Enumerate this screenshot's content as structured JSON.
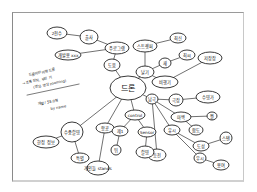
{
  "diagram": {
    "type": "mind-map",
    "style": "hand-drawn",
    "center": {
      "id": "c",
      "label": "드론",
      "x": 128,
      "y": 88,
      "rx": 18,
      "ry": 12
    },
    "nodes": [
      {
        "id": "n1",
        "label": "2천수",
        "x": 57,
        "y": 33,
        "rx": 10,
        "ry": 6
      },
      {
        "id": "n2",
        "label": "출사",
        "x": 89,
        "y": 37,
        "rx": 9,
        "ry": 7
      },
      {
        "id": "n3",
        "label": "주로그램",
        "x": 117,
        "y": 48,
        "rx": 12,
        "ry": 6
      },
      {
        "id": "n4",
        "label": "개발용 xxx",
        "x": 68,
        "y": 55,
        "rx": 13,
        "ry": 5
      },
      {
        "id": "n5",
        "label": "도움",
        "x": 112,
        "y": 65,
        "rx": 8,
        "ry": 6
      },
      {
        "id": "n6",
        "label": "스트렛퍼",
        "x": 145,
        "y": 46,
        "rx": 12,
        "ry": 6
      },
      {
        "id": "n7",
        "label": "최신",
        "x": 178,
        "y": 38,
        "rx": 8,
        "ry": 5
      },
      {
        "id": "n8",
        "label": "날기",
        "x": 145,
        "y": 72,
        "rx": 9,
        "ry": 6
      },
      {
        "id": "n9",
        "label": "새",
        "x": 165,
        "y": 63,
        "rx": 6,
        "ry": 5
      },
      {
        "id": "n10",
        "label": "최씨",
        "x": 187,
        "y": 55,
        "rx": 8,
        "ry": 5
      },
      {
        "id": "n11",
        "label": "비행기",
        "x": 165,
        "y": 82,
        "rx": 13,
        "ry": 6
      },
      {
        "id": "n12",
        "label": "저장장",
        "x": 210,
        "y": 58,
        "rx": 12,
        "ry": 6
      },
      {
        "id": "n13",
        "label": "남극",
        "x": 152,
        "y": 99,
        "rx": 6,
        "ry": 5
      },
      {
        "id": "n14",
        "label": "극장",
        "x": 176,
        "y": 100,
        "rx": 7,
        "ry": 6
      },
      {
        "id": "n15",
        "label": "수영가",
        "x": 208,
        "y": 97,
        "rx": 12,
        "ry": 6
      },
      {
        "id": "n16",
        "label": "마백",
        "x": 181,
        "y": 117,
        "rx": 10,
        "ry": 5
      },
      {
        "id": "n17",
        "label": "뭘",
        "x": 212,
        "y": 116,
        "rx": 5,
        "ry": 4
      },
      {
        "id": "n18",
        "label": "유시",
        "x": 172,
        "y": 130,
        "rx": 8,
        "ry": 5
      },
      {
        "id": "n19",
        "label": "합도",
        "x": 196,
        "y": 130,
        "rx": 7,
        "ry": 5
      },
      {
        "id": "n20",
        "label": "도성",
        "x": 201,
        "y": 146,
        "rx": 8,
        "ry": 5
      },
      {
        "id": "n21",
        "label": "스탠",
        "x": 226,
        "y": 138,
        "rx": 6,
        "ry": 6
      },
      {
        "id": "n22",
        "label": "등전",
        "x": 157,
        "y": 155,
        "rx": 9,
        "ry": 6
      },
      {
        "id": "n23",
        "label": "우시",
        "x": 200,
        "y": 158,
        "rx": 6,
        "ry": 5
      },
      {
        "id": "n24",
        "label": "용여",
        "x": 221,
        "y": 165,
        "rx": 8,
        "ry": 5
      },
      {
        "id": "n25",
        "label": "수중촬영",
        "x": 72,
        "y": 132,
        "rx": 11,
        "ry": 10
      },
      {
        "id": "n26",
        "label": "항공",
        "x": 105,
        "y": 128,
        "rx": 9,
        "ry": 5
      },
      {
        "id": "n27",
        "label": "한정 정보",
        "x": 46,
        "y": 142,
        "rx": 13,
        "ry": 6
      },
      {
        "id": "n28",
        "label": "특별",
        "x": 80,
        "y": 158,
        "rx": 9,
        "ry": 5
      },
      {
        "id": "n29",
        "label": "개인들 stands",
        "x": 98,
        "y": 168,
        "rx": 11,
        "ry": 7
      },
      {
        "id": "n30",
        "label": "control",
        "x": 135,
        "y": 115,
        "rx": 10,
        "ry": 5
      },
      {
        "id": "n31",
        "label": "제1",
        "x": 120,
        "y": 131,
        "rx": 8,
        "ry": 5
      },
      {
        "id": "n32",
        "label": "뒤",
        "x": 116,
        "y": 150,
        "rx": 5,
        "ry": 5
      },
      {
        "id": "n33",
        "label": "Sensor",
        "x": 147,
        "y": 132,
        "rx": 9,
        "ry": 5
      },
      {
        "id": "n34",
        "label": "촬영",
        "x": 145,
        "y": 152,
        "rx": 9,
        "ry": 6
      }
    ],
    "edges": [
      [
        "n1",
        "n2"
      ],
      [
        "n2",
        "n3"
      ],
      [
        "n4",
        "n3"
      ],
      [
        "n3",
        "n5"
      ],
      [
        "n5",
        "c"
      ],
      [
        "c",
        "n8"
      ],
      [
        "n8",
        "n6"
      ],
      [
        "n6",
        "n7"
      ],
      [
        "n8",
        "n9"
      ],
      [
        "n9",
        "n10"
      ],
      [
        "n8",
        "n11"
      ],
      [
        "n11",
        "n12"
      ],
      [
        "c",
        "n13"
      ],
      [
        "n13",
        "n14"
      ],
      [
        "n14",
        "n15"
      ],
      [
        "n13",
        "n16"
      ],
      [
        "n16",
        "n17"
      ],
      [
        "n16",
        "n19"
      ],
      [
        "n13",
        "n18"
      ],
      [
        "n18",
        "n20"
      ],
      [
        "n20",
        "n21"
      ],
      [
        "n18",
        "n23"
      ],
      [
        "n23",
        "n24"
      ],
      [
        "n13",
        "n22"
      ],
      [
        "c",
        "n25"
      ],
      [
        "c",
        "n26"
      ],
      [
        "n25",
        "n27"
      ],
      [
        "n25",
        "n28"
      ],
      [
        "n26",
        "n29"
      ],
      [
        "c",
        "n30"
      ],
      [
        "n30",
        "n31"
      ],
      [
        "n31",
        "n32"
      ],
      [
        "n30",
        "n33"
      ],
      [
        "n33",
        "n34"
      ]
    ],
    "notes": {
      "line1": "드론이란 비행 드론",
      "line2": "→ 조종 장치, 무인 기",
      "line3": "(영상, 영상 zooming)",
      "line4": "개발 / 55.0형",
      "line5": "by name"
    }
  }
}
